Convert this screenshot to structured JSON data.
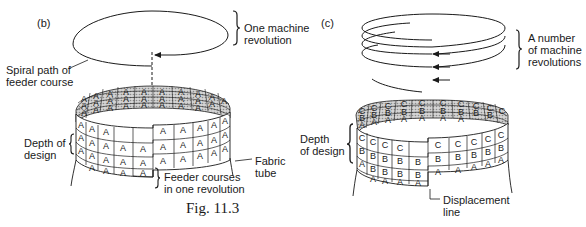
{
  "figure": {
    "caption": "Fig. 11.3",
    "panels": [
      {
        "id": "b",
        "label": "(b)",
        "annotations": {
          "top_brace": [
            "One machine",
            "revolution"
          ],
          "spiral": [
            "Spiral path of",
            "feeder course"
          ],
          "depth": [
            "Depth of",
            "design"
          ],
          "feeder": [
            "Feeder courses",
            "in one revolution"
          ],
          "tube": [
            "Fabric",
            "tube"
          ]
        },
        "cell_letters": {
          "back_rows": [
            "A",
            "A",
            "A"
          ],
          "front_rows": [
            "A",
            "A",
            "A"
          ]
        }
      },
      {
        "id": "c",
        "label": "(c)",
        "annotations": {
          "top_brace": [
            "A number",
            "of machine",
            "revolutions"
          ],
          "depth": [
            "Depth",
            "of design"
          ],
          "displacement": [
            "Displacement",
            "line"
          ]
        },
        "cell_letters": {
          "back_rows": [
            "C",
            "B",
            "A"
          ],
          "front_rows": [
            "C",
            "B",
            "A"
          ]
        }
      }
    ]
  },
  "colors": {
    "ink": "#1a1a1a",
    "shade": "#b8b8b8",
    "paper": "#ffffff"
  }
}
